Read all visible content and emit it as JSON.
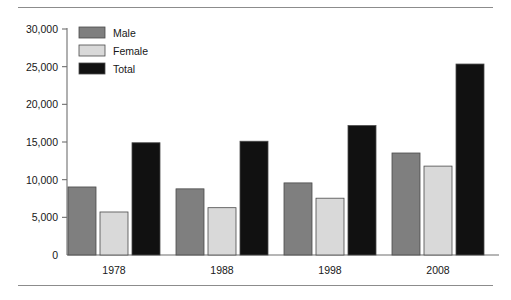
{
  "chart_data": {
    "type": "bar",
    "title": "",
    "subtitle": "",
    "xlabel": "",
    "ylabel": "",
    "categories": [
      "1978",
      "1988",
      "1998",
      "2008"
    ],
    "series": [
      {
        "name": "Male",
        "color": "#7f7f7f",
        "values": [
          9030,
          8780,
          9570,
          13540
        ]
      },
      {
        "name": "Female",
        "color": "#d9d9d9",
        "values": [
          5710,
          6280,
          7540,
          11800
        ]
      },
      {
        "name": "Total",
        "color": "#111111",
        "values": [
          14900,
          15100,
          17180,
          25350
        ]
      }
    ],
    "ylim": [
      0,
      30000
    ],
    "yticks": [
      0,
      5000,
      10000,
      15000,
      20000,
      25000,
      30000
    ],
    "ytick_labels": [
      "0",
      "5,000",
      "10,000",
      "15,000",
      "20,000",
      "25,000",
      "30,000"
    ],
    "xtick_labels": [
      "1978",
      "1988",
      "1998",
      "2008"
    ],
    "grid": false,
    "legend_position": "top-left",
    "legend_entries": [
      {
        "label": "Male",
        "color": "#7f7f7f"
      },
      {
        "label": "Female",
        "color": "#d9d9d9"
      },
      {
        "label": "Total",
        "color": "#111111"
      }
    ],
    "axis_color": "#6f6f6f",
    "bar_border_color": "#4a4a4a",
    "background": "#ffffff"
  },
  "decorations": {
    "top_rule": "horizontal-rule",
    "bottom_rule": "horizontal-rule"
  }
}
